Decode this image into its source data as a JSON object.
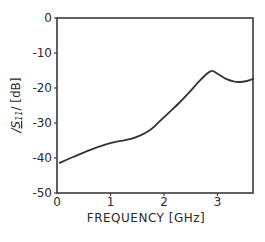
{
  "chart_data": {
    "type": "line",
    "title": "",
    "xlabel": "FREQUENCY [GHz]",
    "ylabel": "|S11| [dB]",
    "ylabel_parts": {
      "prefix": "/",
      "symbol": "S",
      "subscript": "11",
      "suffix": "/ [dB]"
    },
    "xlim": [
      0,
      3.67
    ],
    "ylim": [
      -50,
      0
    ],
    "xticks": [
      0,
      1,
      2,
      3
    ],
    "xtick_labels": [
      "0",
      "1",
      "2",
      "3"
    ],
    "yticks": [
      0,
      -10,
      -20,
      -30,
      -40,
      -50
    ],
    "ytick_labels": [
      "0",
      "-10",
      "-20",
      "-30",
      "-40",
      "-50"
    ],
    "grid": false,
    "legend": null,
    "series": [
      {
        "name": "|S11|",
        "x": [
          0.05,
          0.3,
          0.6,
          0.9,
          1.1,
          1.36,
          1.55,
          1.74,
          1.9,
          2.1,
          2.3,
          2.48,
          2.65,
          2.8,
          2.9,
          3.0,
          3.15,
          3.3,
          3.42,
          3.55,
          3.67
        ],
        "values": [
          -41.4,
          -39.7,
          -37.8,
          -36.2,
          -35.4,
          -34.6,
          -33.6,
          -32.0,
          -29.8,
          -26.9,
          -24.0,
          -21.1,
          -18.2,
          -15.9,
          -15.1,
          -15.9,
          -17.3,
          -18.1,
          -18.3,
          -18.0,
          -17.4
        ]
      }
    ],
    "line_color": "#333333"
  }
}
